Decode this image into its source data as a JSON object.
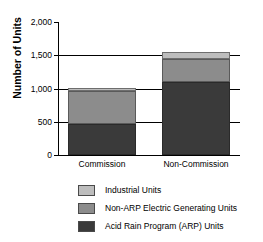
{
  "chart_data": {
    "type": "bar",
    "title": "",
    "subtitle": "",
    "xlabel": "",
    "ylabel": "Number of Units",
    "stacked": true,
    "orientation": "vertical",
    "grid": true,
    "legend_position": "bottom",
    "ylim": [
      0,
      2000
    ],
    "yticks": [
      0,
      500,
      1000,
      1500,
      2000
    ],
    "ytick_labels": [
      "0",
      "500",
      "1,000",
      "1,500",
      "2,000"
    ],
    "categories": [
      "Commission",
      "Non-Commission"
    ],
    "series": [
      {
        "name": "Acid Rain Program (ARP) Units",
        "color": "#3a3a3a",
        "values": [
          470,
          1100
        ]
      },
      {
        "name": "Non-ARP Electric Generating Units",
        "color": "#8c8c8c",
        "values": [
          495,
          340
        ]
      },
      {
        "name": "Industrial Units",
        "color": "#bdbdbd",
        "values": [
          45,
          110
        ]
      }
    ],
    "totals": [
      1010,
      1550
    ],
    "legend_entries": [
      "Industrial Units",
      "Non-ARP Electric Generating Units",
      "Acid Rain Program (ARP) Units"
    ]
  }
}
